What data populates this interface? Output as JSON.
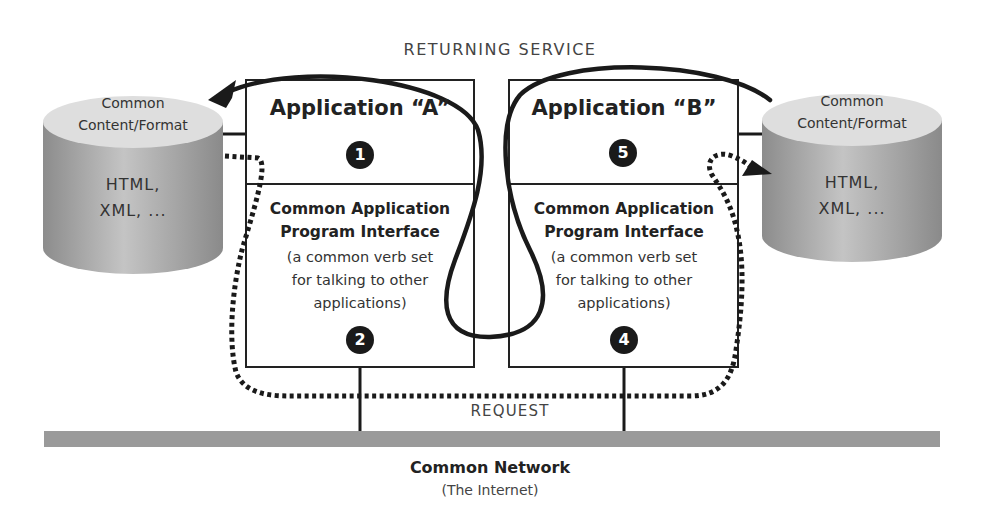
{
  "diagram": {
    "flows": {
      "returning_service": "RETURNING SERVICE",
      "request": "REQUEST"
    },
    "network": {
      "title": "Common Network",
      "subtitle": "(The Internet)",
      "color": "#9a9a9a"
    },
    "left_store": {
      "top_line1": "Common",
      "top_line2": "Content/Format",
      "body_line1": "HTML,",
      "body_line2": "XML, ..."
    },
    "right_store": {
      "top_line1": "Common",
      "top_line2": "Content/Format",
      "body_line1": "HTML,",
      "body_line2": "XML, ..."
    },
    "app_a": {
      "title": "Application “A”",
      "app_step": "1",
      "api_title_line1": "Common Application",
      "api_title_line2": "Program Interface",
      "api_desc_line1": "(a common verb set",
      "api_desc_line2": "for talking to other",
      "api_desc_line3": "applications)",
      "api_step": "2"
    },
    "app_b": {
      "title": "Application “B”",
      "app_step": "5",
      "api_title_line1": "Common Application",
      "api_title_line2": "Program Interface",
      "api_desc_line1": "(a common verb set",
      "api_desc_line2": "for talking to other",
      "api_desc_line3": "applications)",
      "api_step": "4"
    },
    "network_step": "3"
  }
}
